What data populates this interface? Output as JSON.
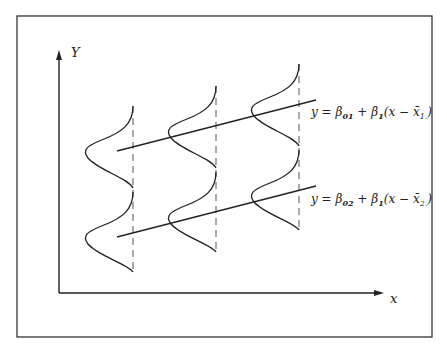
{
  "figure": {
    "axes": {
      "y_label": "Y",
      "x_label": "x"
    },
    "lines": [
      {
        "name": "group-1-regression",
        "equation_parts": {
          "lhs": "y = β",
          "sub1": "01",
          "mid": " + β",
          "sub2": "1",
          "rest": "(x − x̄",
          "sub3": "1.",
          "end": ")"
        }
      },
      {
        "name": "group-2-regression",
        "equation_parts": {
          "lhs": "y = β",
          "sub1": "02",
          "mid": " + β",
          "sub2": "1",
          "rest": "(x − x̄",
          "sub3": "2.",
          "end": ")"
        }
      }
    ],
    "colors": {
      "stroke": "#222222",
      "dashed": "#555555",
      "border": "#333333"
    }
  }
}
